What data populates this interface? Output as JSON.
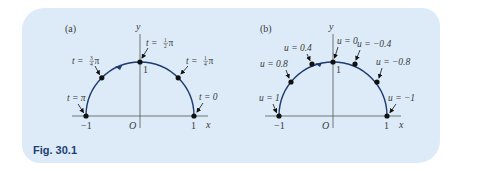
{
  "figure": {
    "caption": "Fig. 30.1",
    "colors": {
      "panel_bg": "#dcebf7",
      "curve": "#1f3a6e",
      "axis": "#555555",
      "caption": "#1f3f73"
    },
    "panels": [
      {
        "id": "a",
        "label": "(a)",
        "axis_labels": {
          "x": "x",
          "y": "y",
          "origin": "O",
          "x_neg": "−1",
          "x_pos": "1",
          "y_top": "1"
        },
        "points": [
          {
            "param": "t",
            "value": "0"
          },
          {
            "param": "t",
            "value": "¼π"
          },
          {
            "param": "t",
            "value": "½π"
          },
          {
            "param": "t",
            "value": "¾π"
          },
          {
            "param": "t",
            "value": "π"
          }
        ]
      },
      {
        "id": "b",
        "label": "(b)",
        "axis_labels": {
          "x": "x",
          "y": "y",
          "origin": "O",
          "x_neg": "−1",
          "x_pos": "1",
          "y_top": "1"
        },
        "points": [
          {
            "param": "u",
            "value": "−1"
          },
          {
            "param": "u",
            "value": "−0.8"
          },
          {
            "param": "u",
            "value": "−0.4"
          },
          {
            "param": "u",
            "value": "0"
          },
          {
            "param": "u",
            "value": "0.4"
          },
          {
            "param": "u",
            "value": "0.8"
          },
          {
            "param": "u",
            "value": "1"
          }
        ]
      }
    ]
  },
  "labels": {
    "a": {
      "panel": "(a)",
      "y": "y",
      "x": "x",
      "O": "O",
      "neg1": "−1",
      "pos1": "1",
      "top1": "1",
      "t0": "t = 0",
      "t_quarter_pre": "t = ",
      "t_quarter_num": "1",
      "t_quarter_den": "4",
      "t_quarter_post": "π",
      "t_half_pre": "t = ",
      "t_half_num": "1",
      "t_half_den": "2",
      "t_half_post": "π",
      "t_3q_pre": "t = ",
      "t_3q_num": "3",
      "t_3q_den": "4",
      "t_3q_post": "π",
      "t_pi": "t = π"
    },
    "b": {
      "panel": "(b)",
      "y": "y",
      "x": "x",
      "O": "O",
      "neg1": "−1",
      "pos1": "1",
      "top1": "1",
      "u_neg1": "u = −1",
      "u_neg08": "u = −0.8",
      "u_neg04": "u = −0.4",
      "u_0": "u = 0",
      "u_04": "u = 0.4",
      "u_08": "u = 0.8",
      "u_1": "u = 1"
    }
  }
}
